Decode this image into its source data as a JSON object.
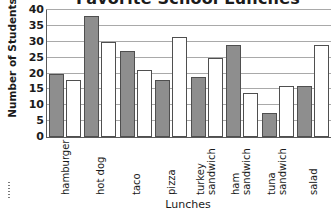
{
  "chart_data": {
    "type": "bar",
    "title": "Favorite School Lunches",
    "xlabel": "Lunches",
    "ylabel": "Number of Students",
    "ylim": [
      0,
      40
    ],
    "ytick_step": 5,
    "yticks": [
      0,
      5,
      10,
      15,
      20,
      25,
      30,
      35,
      40
    ],
    "grid": true,
    "legend": "none",
    "categories": [
      "hamburger",
      "hot dog",
      "taco",
      "pizza",
      "turkey sandwich",
      "ham sandwich",
      "tuna sandwich",
      "salad"
    ],
    "category_lines": [
      [
        "hamburger"
      ],
      [
        "hot dog"
      ],
      [
        "taco"
      ],
      [
        "pizza"
      ],
      [
        "turkey",
        "sandwich"
      ],
      [
        "ham",
        "sandwich"
      ],
      [
        "tuna",
        "sandwich"
      ],
      [
        "salad"
      ]
    ],
    "series": [
      {
        "name": "gray-series",
        "color": "#8e8e8e",
        "values": [
          20,
          38,
          27,
          18,
          19,
          29,
          7.5,
          16
        ]
      },
      {
        "name": "white-series",
        "color": "#ffffff",
        "values": [
          18,
          30,
          21,
          31.5,
          25,
          14,
          16,
          29
        ]
      }
    ]
  },
  "axes": {
    "y_tick_labels": [
      "40",
      "35",
      "30",
      "25",
      "20",
      "15",
      "10",
      "5",
      "0"
    ]
  }
}
